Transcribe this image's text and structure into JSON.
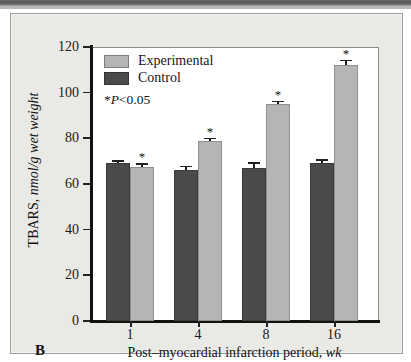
{
  "figure": {
    "panel_letter": "B",
    "legend": {
      "experimental_label": "Experimental",
      "control_label": "Control",
      "pvalue_note_prefix": "*",
      "pvalue_note_italic": "P",
      "pvalue_note_rest": "<0.05"
    },
    "colors": {
      "experimental": "#b5b5b5",
      "control": "#4a4a4a",
      "panel_background": "#e9e9e6",
      "plot_background": "#ffffff",
      "axis": "#111111"
    }
  },
  "chart_data": {
    "type": "bar",
    "title": "",
    "xlabel_main": "Post–myocardial infarction period, ",
    "xlabel_italic": "wk",
    "ylabel_main": "TBARS, ",
    "ylabel_italic": "nmol/g wet weight",
    "categories": [
      "1",
      "4",
      "8",
      "16"
    ],
    "ylim": [
      0,
      120
    ],
    "yticks": [
      0,
      20,
      40,
      60,
      80,
      100,
      120
    ],
    "ytick_labels": [
      "0",
      "20",
      "40",
      "60",
      "80",
      "100",
      "120"
    ],
    "grid": false,
    "legend_position": "upper-left-inside",
    "series": [
      {
        "name": "Control",
        "color": "#4a4a4a",
        "values": [
          69,
          66,
          67,
          69
        ],
        "errors": [
          1.5,
          2.0,
          2.5,
          1.8
        ],
        "significance": [
          "",
          "",
          "",
          ""
        ]
      },
      {
        "name": "Experimental",
        "color": "#b5b5b5",
        "values": [
          67.5,
          79,
          95,
          112
        ],
        "errors": [
          1.5,
          1.0,
          1.5,
          2.5
        ],
        "significance": [
          "*",
          "*",
          "*",
          "*"
        ]
      }
    ],
    "annotations": [
      "*P<0.05"
    ]
  }
}
